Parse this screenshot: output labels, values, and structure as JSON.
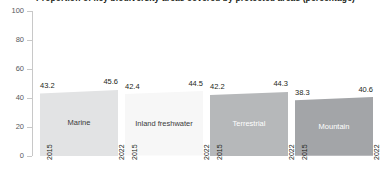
{
  "title": "Proportion of key biodiversity areas covered by protected areas (percentage)",
  "chart_data": {
    "type": "bar",
    "title": "Proportion of key biodiversity areas covered by protected areas (percentage)",
    "xlabel": "",
    "ylabel": "",
    "ylim": [
      0,
      100
    ],
    "yticks": [
      0,
      20,
      40,
      60,
      80,
      100
    ],
    "grid": false,
    "legend": "none",
    "x": [
      "2015",
      "2022"
    ],
    "categories": [
      "Marine",
      "Inland freshwater",
      "Terrestrial",
      "Mountain"
    ],
    "series": [
      {
        "name": "2015",
        "values": [
          43.2,
          42.4,
          42.2,
          38.3
        ]
      },
      {
        "name": "2022",
        "values": [
          45.6,
          44.5,
          44.3,
          40.6
        ]
      }
    ],
    "bars": [
      {
        "label": "Marine",
        "start_year": "2015",
        "end_year": "2022",
        "start_value": 43.2,
        "end_value": 45.6,
        "color": "#e2e3e4",
        "label_color": "#3a3a3c"
      },
      {
        "label": "Inland freshwater",
        "start_year": "2015",
        "end_year": "2022",
        "start_value": 42.4,
        "end_value": 44.5,
        "color": "#f7f7f7",
        "label_color": "#3a3a3c"
      },
      {
        "label": "Terrestrial",
        "start_year": "2015",
        "end_year": "2022",
        "start_value": 42.2,
        "end_value": 44.3,
        "color": "#b6b8ba",
        "label_color": "#ffffff"
      },
      {
        "label": "Mountain",
        "start_year": "2015",
        "end_year": "2022",
        "start_value": 38.3,
        "end_value": 40.6,
        "color": "#a3a5a8",
        "label_color": "#ffffff"
      }
    ]
  },
  "axis": {
    "y_labels": [
      "100",
      "80",
      "60",
      "40",
      "20",
      "0"
    ],
    "axis_color": "#c8c8c8"
  }
}
